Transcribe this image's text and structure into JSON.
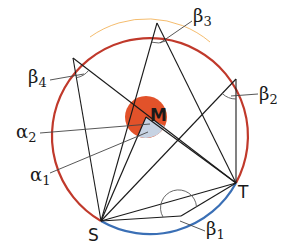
{
  "figure": {
    "type": "inscribed-angle-theorem-diagram",
    "circle": {
      "center": [
        146,
        117
      ],
      "radius": 98,
      "major_arc_color": "#c0392b",
      "minor_arc_color": "#3a6fb5"
    },
    "center_disk": {
      "radius": 21,
      "color": "#e2522a"
    },
    "central_angle_sector_color": "#c7d3e3",
    "points": {
      "M": {
        "label": "M",
        "xy": [
          146,
          117
        ]
      },
      "S": {
        "label": "S",
        "xy": [
          101,
          221
        ]
      },
      "T": {
        "label": "T",
        "xy": [
          236,
          183
        ]
      }
    },
    "angle_labels": {
      "beta1": {
        "symbol": "β",
        "index": "1"
      },
      "beta2": {
        "symbol": "β",
        "index": "2"
      },
      "beta3": {
        "symbol": "β",
        "index": "3"
      },
      "beta4": {
        "symbol": "β",
        "index": "4"
      },
      "alpha1": {
        "symbol": "α",
        "index": "1"
      },
      "alpha2": {
        "symbol": "α",
        "index": "2"
      }
    },
    "line_color": "#1a1a1a"
  }
}
